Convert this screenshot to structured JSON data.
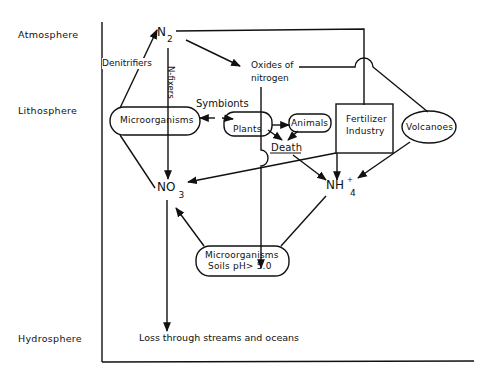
{
  "diagram": {
    "type": "nitrogen-cycle",
    "spheres": {
      "atmosphere": "Atmosphere",
      "lithosphere": "Lithosphere",
      "hydrosphere": "Hydrosphere"
    },
    "nodes": {
      "n2": {
        "main": "N",
        "sub": "2"
      },
      "oxides": {
        "line1": "Oxides of",
        "line2": "nitrogen"
      },
      "microorganisms_top": "Microorganisms",
      "plants": "Plants",
      "animals": "Animals",
      "death": "Death",
      "fertilizer": {
        "line1": "Fertilizer",
        "line2": "Industry"
      },
      "volcanoes": "Volcanoes",
      "no3": {
        "main": "NO",
        "sub": "3"
      },
      "nh4": {
        "main": "NH",
        "sup": "+",
        "sub": "4"
      },
      "microorganisms_soil": {
        "line1": "Microorganisms",
        "line2": "Soils pH> 5.0"
      },
      "loss": "Loss through streams and oceans"
    },
    "edge_labels": {
      "denitrifiers": "Denitrifiers",
      "n_fixers": "N-fixers",
      "symbionts": "Symbionts"
    },
    "edges": [
      {
        "from": "Microorganisms",
        "to": "N2",
        "label": "Denitrifiers"
      },
      {
        "from": "N2",
        "to": "NO3",
        "label": "N-fixers"
      },
      {
        "from": "N2",
        "to": "Oxides of nitrogen"
      },
      {
        "from": "N2",
        "to": "Fertilizer Industry"
      },
      {
        "from": "Oxides of nitrogen",
        "to": "Microorganisms Soils"
      },
      {
        "from": "Oxides of nitrogen",
        "to": "Volcanoes"
      },
      {
        "from": "Microorganisms",
        "to": "Plants",
        "label": "Symbionts"
      },
      {
        "from": "Plants",
        "to": "Animals"
      },
      {
        "from": "Plants",
        "to": "Death"
      },
      {
        "from": "Animals",
        "to": "Death"
      },
      {
        "from": "Death",
        "to": "NH4+"
      },
      {
        "from": "Fertilizer Industry",
        "to": "NO3"
      },
      {
        "from": "Fertilizer Industry",
        "to": "NH4+"
      },
      {
        "from": "Volcanoes",
        "to": "NH4+"
      },
      {
        "from": "Microorganisms Soils",
        "to": "NO3"
      },
      {
        "from": "NH4+",
        "to": "Microorganisms Soils"
      },
      {
        "from": "NO3",
        "to": "Microorganisms"
      },
      {
        "from": "NO3",
        "to": "Loss through streams and oceans"
      }
    ]
  }
}
